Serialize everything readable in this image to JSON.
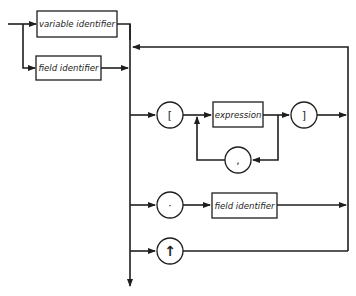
{
  "diagram": {
    "type": "syntax-diagram",
    "start_boxes": [
      {
        "id": "variable-identifier",
        "label": "variable identifier"
      },
      {
        "id": "field-identifier-start",
        "label": "field identifier"
      }
    ],
    "selectors": {
      "index": {
        "open_symbol": "[",
        "box_label": "expression",
        "separator_symbol": ",",
        "close_symbol": "]"
      },
      "field": {
        "symbol": "·",
        "box_label": "field identifier"
      },
      "pointer": {
        "symbol": "↑"
      }
    },
    "colors": {
      "stroke": "#1e1e1e",
      "background": "#ffffff"
    }
  }
}
